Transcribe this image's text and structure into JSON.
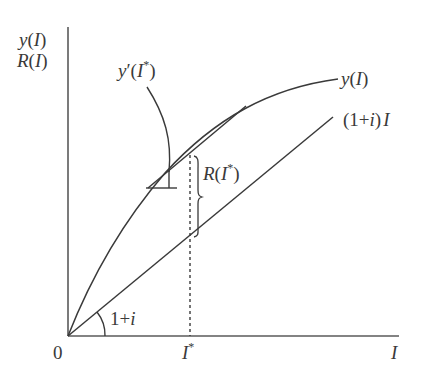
{
  "diagram": {
    "type": "economics-function-plot",
    "y_axis_labels": [
      "y(I)",
      "R(I)"
    ],
    "x_axis_label": "I",
    "origin_label": "0",
    "x_tick_label": "I*",
    "curve_label": "y(I)",
    "line_label": "(1+i)I",
    "tangent_label": "y′(I*)",
    "gap_label": "R(I*)",
    "angle_label": "1+i",
    "colors": {
      "stroke": "#3a3a3a",
      "background": "#ffffff"
    }
  },
  "labels": {
    "y_axis_top": "y(I)",
    "y_axis_bottom": "R(I)",
    "x_axis": "I",
    "origin": "0",
    "i_star": "I",
    "i_star_sup": "*",
    "curve": "y(I)",
    "line": "(1+i)I",
    "derivative": "y′(I",
    "derivative_sup": "*",
    "derivative_close": ")",
    "r_star": "R(I",
    "r_star_sup": "*",
    "r_star_close": ")",
    "angle": "1+i"
  }
}
